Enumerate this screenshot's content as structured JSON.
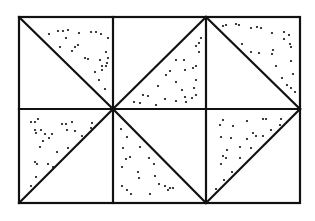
{
  "diagram": {
    "colors": {
      "line": "#111111",
      "background": "#ffffff",
      "stipple": "#111111"
    },
    "outer_rect": {
      "x": 19,
      "y": 17,
      "w": 281,
      "h": 186
    },
    "grid": {
      "cols": 3,
      "rows": 2,
      "col_x": [
        19,
        113,
        206,
        300
      ],
      "row_y": [
        17,
        109,
        203
      ]
    },
    "cells": [
      {
        "id": "top-left",
        "diagonal": [
          [
            19,
            17
          ],
          [
            113,
            109
          ]
        ],
        "stippled": "upper-right"
      },
      {
        "id": "top-middle",
        "diagonal": [
          [
            113,
            109
          ],
          [
            206,
            17
          ]
        ],
        "stippled": "lower-right"
      },
      {
        "id": "top-right",
        "diagonal": [
          [
            206,
            17
          ],
          [
            300,
            109
          ]
        ],
        "stippled": "upper-right"
      },
      {
        "id": "bottom-left",
        "diagonal": [
          [
            19,
            203
          ],
          [
            113,
            109
          ]
        ],
        "stippled": "upper-left"
      },
      {
        "id": "bottom-middle",
        "diagonal": [
          [
            113,
            109
          ],
          [
            206,
            203
          ]
        ],
        "stippled": "lower-left"
      },
      {
        "id": "bottom-right",
        "diagonal": [
          [
            206,
            203
          ],
          [
            300,
            109
          ]
        ],
        "stippled": "upper-left"
      }
    ]
  }
}
